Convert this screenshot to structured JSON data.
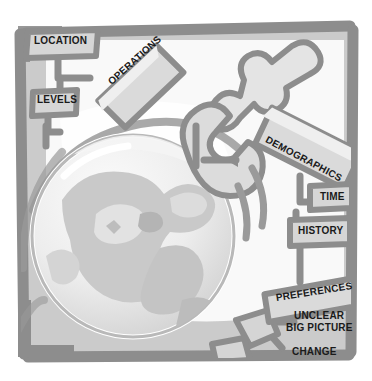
{
  "image": {
    "title": "Globe lifted by wrench with labeled callout tags",
    "type": "grayscale-clipart-illustration",
    "width": 372,
    "height": 381
  },
  "palette": {
    "background": "#ffffff",
    "frame_gray": "#8d8d8d",
    "panel_fill": "#cfcfcf",
    "tag_fill": "#d2d2d2",
    "tag_highlight": "#eaeaea",
    "globe_light": "#f1f1f1",
    "globe_mid": "#d8d8d8",
    "globe_dark": "#b6b6b6",
    "outline": "#8a8a8a",
    "text": "#1a1a1a"
  },
  "frame": {
    "name": "picture-frame-border",
    "stroke": "#8d8d8d",
    "thickness": 11
  },
  "globe": {
    "name": "globe-sphere",
    "center_x": 133,
    "center_y": 236,
    "radius": 101,
    "has_continents": true,
    "has_orbit_arcs": true
  },
  "tool": {
    "name": "wrench-clamp-tool",
    "description": "open-end wrench gripping the top of the globe"
  },
  "tags": [
    {
      "id": "location",
      "label": "LOCATION",
      "shape": "box",
      "rotation": 0,
      "x": 30,
      "y": 34,
      "font_size": 10
    },
    {
      "id": "levels",
      "label": "LEVELS",
      "shape": "box",
      "rotation": 0,
      "x": 35,
      "y": 94,
      "font_size": 10
    },
    {
      "id": "operations",
      "label": "OPERATIONS",
      "shape": "box",
      "rotation": -42,
      "x": 108,
      "y": 63,
      "font_size": 10
    },
    {
      "id": "demographics",
      "label": "DEMOGRAPHICS",
      "shape": "box",
      "rotation": 28,
      "x": 265,
      "y": 128,
      "font_size": 10
    },
    {
      "id": "time",
      "label": "TIME",
      "shape": "box",
      "rotation": 0,
      "x": 316,
      "y": 191,
      "font_size": 10
    },
    {
      "id": "history",
      "label": "HISTORY",
      "shape": "box",
      "rotation": 0,
      "x": 296,
      "y": 225,
      "font_size": 10
    },
    {
      "id": "preferences",
      "label": "PREFERENCES",
      "shape": "box",
      "rotation": -9,
      "x": 277,
      "y": 290,
      "font_size": 10
    },
    {
      "id": "unclear-big-picture",
      "label": "UNCLEAR",
      "label2": "BIG PICTURE",
      "shape": "text",
      "rotation": 0,
      "x": 291,
      "y": 310,
      "font_size": 10
    },
    {
      "id": "change",
      "label": "CHANGE",
      "shape": "text",
      "rotation": 0,
      "x": 290,
      "y": 345,
      "font_size": 10
    }
  ]
}
